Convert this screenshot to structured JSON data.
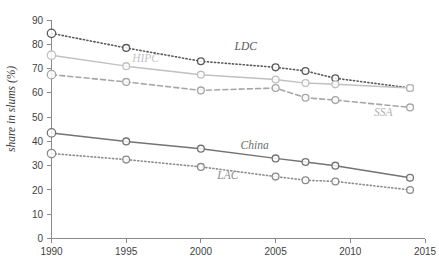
{
  "chart_data": {
    "type": "line",
    "title": "",
    "xlabel": "",
    "ylabel": "share in slums (%)",
    "xlim": [
      1990,
      2015
    ],
    "ylim": [
      0,
      90
    ],
    "ytick_step": 10,
    "xtick_step": 5,
    "grid": false,
    "legend_position": "inline-labels",
    "x": [
      1990,
      1995,
      2000,
      2005,
      2007,
      2009,
      2014
    ],
    "xticks": [
      "1990",
      "1995",
      "2000",
      "2005",
      "2010",
      "2015"
    ],
    "yticks": [
      "0",
      "10",
      "20",
      "30",
      "40",
      "50",
      "60",
      "70",
      "80",
      "90"
    ],
    "series": [
      {
        "name": "LDC",
        "label": "LDC",
        "color": "#595959",
        "style": "dotted",
        "marker": "circle",
        "values": [
          84.5,
          78.5,
          73.0,
          70.5,
          69.0,
          66.0,
          62.0
        ]
      },
      {
        "name": "HIPC",
        "label": "HIPC",
        "color": "#c0c0c0",
        "style": "solid",
        "marker": "circle",
        "values": [
          75.5,
          71.0,
          67.5,
          65.5,
          64.0,
          63.5,
          62.0
        ]
      },
      {
        "name": "SSA",
        "label": "SSA",
        "color": "#a6a6a6",
        "style": "dashed",
        "marker": "circle",
        "values": [
          67.5,
          64.5,
          61.0,
          62.0,
          58.0,
          57.0,
          54.0
        ]
      },
      {
        "name": "China",
        "label": "China",
        "color": "#737373",
        "style": "solid",
        "marker": "circle",
        "values": [
          43.5,
          40.0,
          37.0,
          33.0,
          31.5,
          30.0,
          25.0
        ]
      },
      {
        "name": "LAC",
        "label": "LAC",
        "color": "#8c8c8c",
        "style": "dotted",
        "marker": "circle",
        "values": [
          35.0,
          32.5,
          29.5,
          25.5,
          24.0,
          23.5,
          20.0
        ]
      }
    ],
    "annotations": [
      {
        "text": "LDC",
        "x": 2003.0,
        "y": 77.5,
        "color": "#595959"
      },
      {
        "text": "HIPC",
        "x": 1996.3,
        "y": 72.5,
        "color": "#c3c3c3"
      },
      {
        "text": "SSA",
        "x": 2012.2,
        "y": 50.5,
        "color": "#b0b0b0"
      },
      {
        "text": "China",
        "x": 2003.6,
        "y": 37.0,
        "color": "#6e6e6e"
      },
      {
        "text": "LAC",
        "x": 2001.8,
        "y": 24.5,
        "color": "#8c8c8c"
      }
    ]
  },
  "caption": {
    "text": ""
  },
  "colors": {
    "axis": "#8a8a8a",
    "text": "#3f3f3f",
    "background": "#ffffff"
  }
}
